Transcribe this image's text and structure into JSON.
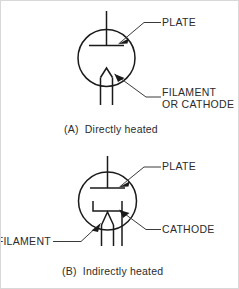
{
  "figure": {
    "background_color": "#ffffff",
    "line_color": "#1a1a1a",
    "text_color": "#2b2b2b",
    "diagrams": [
      {
        "id": "directly-heated",
        "caption": "(A)  Directly heated",
        "labels": [
          {
            "name": "plate",
            "lines": [
              "PLATE"
            ]
          },
          {
            "name": "filament-or-cathode",
            "lines": [
              "FILAMENT",
              "OR CATHODE"
            ]
          }
        ],
        "elements": [
          "envelope",
          "plate-electrode",
          "plate-lead",
          "filament-electrode",
          "filament-leads"
        ]
      },
      {
        "id": "indirectly-heated",
        "caption": "(B)  Indirectly heated",
        "labels": [
          {
            "name": "plate",
            "lines": [
              "PLATE"
            ]
          },
          {
            "name": "cathode",
            "lines": [
              "CATHODE"
            ]
          },
          {
            "name": "filament",
            "lines": [
              "FILAMENT"
            ]
          }
        ],
        "elements": [
          "envelope",
          "plate-electrode",
          "plate-lead",
          "cathode-electrode",
          "cathode-lead",
          "filament-electrode",
          "filament-leads"
        ]
      }
    ]
  },
  "text": {
    "a": {
      "plate": "PLATE",
      "filament_line1": "FILAMENT",
      "filament_line2": "OR CATHODE",
      "caption": "(A)  Directly heated"
    },
    "b": {
      "plate": "PLATE",
      "cathode": "CATHODE",
      "filament": "FILAMENT",
      "caption": "(B)  Indirectly heated"
    }
  }
}
